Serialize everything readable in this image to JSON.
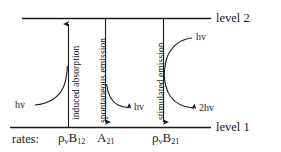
{
  "diagram": {
    "levels": [
      {
        "id": "level2",
        "label": "level 2"
      },
      {
        "id": "level1",
        "label": "level 1"
      }
    ],
    "processes": [
      {
        "id": "induced-absorption",
        "label": "induced absorption",
        "direction": "up",
        "rate_label": {
          "rho": "ρ",
          "rho_sub": "v",
          "coeff": "B",
          "coeff_sub": "12"
        }
      },
      {
        "id": "spontaneous-emission",
        "label": "spontaneous emission",
        "direction": "down",
        "rate_label": {
          "rho": "",
          "rho_sub": "",
          "coeff": "A",
          "coeff_sub": "21"
        }
      },
      {
        "id": "stimulated-emission",
        "label": "stimulated emission",
        "direction": "down",
        "rate_label": {
          "rho": "ρ",
          "rho_sub": "v",
          "coeff": "B",
          "coeff_sub": "21"
        }
      }
    ],
    "photons": [
      {
        "id": "photon-in-absorption",
        "text": "hv"
      },
      {
        "id": "photon-out-spontaneous",
        "text": "hv"
      },
      {
        "id": "photon-in-stimulated",
        "text": "hv"
      },
      {
        "id": "photon-out-stimulated",
        "text": "2hv"
      }
    ],
    "rates_caption": "rates:",
    "colors": {
      "line": "#1a1a1a",
      "text": "#1a1a1a",
      "background": "#ffffff"
    }
  }
}
